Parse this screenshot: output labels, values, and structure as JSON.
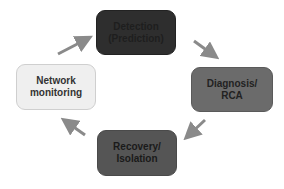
{
  "diagram": {
    "type": "cycle",
    "nodes": [
      {
        "id": "detection",
        "label": "Detection\n(Prediction)",
        "fill": "#2e2e2e"
      },
      {
        "id": "diagnosis",
        "label": "Diagnosis/\nRCA",
        "fill": "#6b6b6b"
      },
      {
        "id": "recovery",
        "label": "Recovery/\nIsolation",
        "fill": "#555555"
      },
      {
        "id": "network",
        "label": "Network\nmonitoring",
        "fill": "#efefef"
      }
    ],
    "edges": [
      {
        "from": "network",
        "to": "detection"
      },
      {
        "from": "detection",
        "to": "diagnosis"
      },
      {
        "from": "diagnosis",
        "to": "recovery"
      },
      {
        "from": "recovery",
        "to": "network"
      }
    ],
    "arrow_color": "#8a8a8a"
  }
}
